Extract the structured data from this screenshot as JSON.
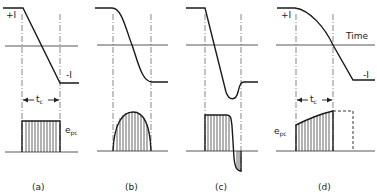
{
  "figure": {
    "panels": [
      {
        "id": "a",
        "caption": "(a)",
        "current_waveform": "linear ramp from +I to -I",
        "voltage_waveform": "rectangular pulse"
      },
      {
        "id": "b",
        "caption": "(b)",
        "current_waveform": "sinusoidal S-curve from +I to -I",
        "voltage_waveform": "half-sine arch"
      },
      {
        "id": "c",
        "caption": "(c)",
        "current_waveform": "linear ramp with overshoot below -I then recovery",
        "voltage_waveform": "rectangular pulse with negative spike"
      },
      {
        "id": "d",
        "caption": "(d)",
        "current_waveform": "curved decay crossing zero",
        "voltage_waveform": "rising-top pulse with dashed continuation"
      }
    ],
    "labels": {
      "plus_i": "+I",
      "minus_i": "-I",
      "time": "Time",
      "tc_main": "t",
      "tc_sub": "c",
      "epc_main": "e",
      "epc_sub": "pc"
    }
  }
}
